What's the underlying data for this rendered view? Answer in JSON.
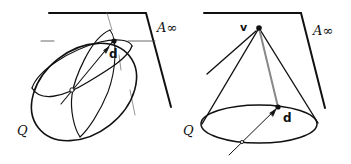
{
  "figure": {
    "panels": [
      {
        "id": "left",
        "shape": "ellipsoid",
        "labels": {
          "plane": "A∞",
          "point": "d",
          "surface": "Q"
        }
      },
      {
        "id": "right",
        "shape": "cone",
        "labels": {
          "plane": "A∞",
          "vertex": "v",
          "point": "d",
          "surface": "Q"
        }
      }
    ],
    "colors": {
      "ink": "#111111",
      "background": "#ffffff",
      "thin_line": "#777777"
    }
  }
}
